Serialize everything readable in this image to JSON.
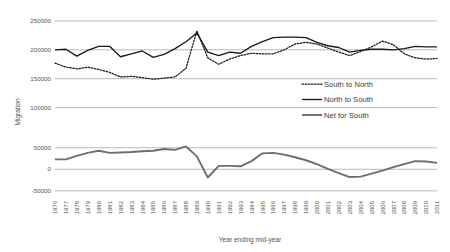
{
  "chart_data": {
    "type": "line",
    "title": "",
    "xlabel": "Year ending mid-year",
    "ylabel": "Migration",
    "panels": [
      {
        "name": "upper-panel",
        "ylim": [
          75000,
          262000
        ],
        "yticks": [
          250000,
          200000,
          150000,
          100000
        ],
        "ytick_labels": [
          "250000",
          "200000",
          "150000",
          "100000"
        ],
        "grid": true
      },
      {
        "name": "lower-panel",
        "ylim": [
          -62000,
          68000
        ],
        "yticks": [
          50000,
          0,
          -50000
        ],
        "ytick_labels": [
          "50000",
          "0",
          "-50000"
        ],
        "grid": true
      }
    ],
    "categories": [
      "1976",
      "1977",
      "1978",
      "1979",
      "1980",
      "1981",
      "1982",
      "1983",
      "1984",
      "1985",
      "1986",
      "1987",
      "1988",
      "1989",
      "1990",
      "1991",
      "1992",
      "1993",
      "1994",
      "1995",
      "1996",
      "1997",
      "1998",
      "1999",
      "2000",
      "2001",
      "2002",
      "2003",
      "2004",
      "2005",
      "2006",
      "2007",
      "2008",
      "2009",
      "2010",
      "2011"
    ],
    "series": [
      {
        "name": "South to North",
        "style": "dotted",
        "color": "#1a1a1a",
        "panel": "upper-panel",
        "values": [
          177000,
          170000,
          167000,
          170000,
          166000,
          161000,
          153000,
          154000,
          152000,
          149000,
          151000,
          153000,
          168000,
          233000,
          186000,
          175000,
          184000,
          190000,
          194000,
          193000,
          193000,
          200000,
          210000,
          213000,
          210000,
          203000,
          196000,
          190000,
          197000,
          205000,
          215000,
          209000,
          193000,
          186000,
          184000,
          185000
        ]
      },
      {
        "name": "North to South",
        "style": "solid-thin",
        "color": "#1a1a1a",
        "panel": "upper-panel",
        "values": [
          200000,
          201000,
          189000,
          199000,
          206000,
          206000,
          188000,
          193000,
          198000,
          187000,
          192000,
          202000,
          214000,
          229000,
          196000,
          190000,
          196000,
          194000,
          206000,
          214000,
          221000,
          222000,
          222000,
          221000,
          213000,
          207000,
          204000,
          196000,
          199000,
          201000,
          201000,
          200000,
          202000,
          206000,
          205000,
          205000
        ]
      },
      {
        "name": "Net for South",
        "style": "solid-thick",
        "color": "#6e6e6e",
        "panel": "lower-panel",
        "values": [
          23000,
          23000,
          31000,
          38000,
          43000,
          38000,
          39000,
          40000,
          42000,
          43000,
          47000,
          45000,
          53000,
          30000,
          -19000,
          8000,
          8000,
          7000,
          19000,
          37000,
          38000,
          34000,
          28000,
          21000,
          12000,
          1000,
          -9000,
          -18000,
          -17000,
          -10000,
          -3000,
          5000,
          12000,
          19000,
          18000,
          15000
        ]
      }
    ],
    "legend": {
      "position": "inside-right",
      "entries": [
        {
          "label": "South to North",
          "style": "dotted"
        },
        {
          "label": "North to South",
          "style": "solid-thin"
        },
        {
          "label": "Net for South",
          "style": "solid-thick"
        }
      ]
    }
  }
}
